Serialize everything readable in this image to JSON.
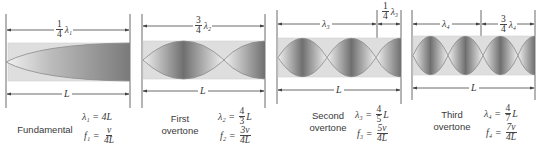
{
  "figure": {
    "colors": {
      "tube_fill": "#d9d9d9",
      "tube_border": "#c8c8c8",
      "node_dark": "#6e6e6e",
      "wave_line": "#8a8a8a",
      "dim_line": "#444444",
      "text": "#333333"
    },
    "panels": [
      {
        "id": "fundamental",
        "top_dimension": [
          {
            "type": "fraction",
            "num": "1",
            "den": "4",
            "symbol": "λ₁"
          }
        ],
        "bottom_dimension": "L",
        "label_lines": [
          "Fundamental"
        ],
        "wavelength_eq": {
          "lhs": "λ₁ =",
          "rhs_plain": "4L"
        },
        "frequency_eq": {
          "lhs": "f₁ =",
          "num": "v",
          "den": "4L"
        },
        "quarter_waves": 1
      },
      {
        "id": "first-overtone",
        "top_dimension": [
          {
            "type": "fraction",
            "num": "3",
            "den": "4",
            "symbol": "λ₂"
          }
        ],
        "bottom_dimension": "L",
        "label_lines": [
          "First",
          "overtone"
        ],
        "wavelength_eq": {
          "lhs": "λ₂ =",
          "num": "4",
          "den": "3",
          "suffix": "L"
        },
        "frequency_eq": {
          "lhs": "f₂ =",
          "num": "3v",
          "den": "4L"
        },
        "quarter_waves": 3
      },
      {
        "id": "second-overtone",
        "top_dimension": [
          {
            "type": "plain",
            "symbol": "λ₃"
          },
          {
            "type": "fraction",
            "num": "1",
            "den": "4",
            "symbol": "λ₃"
          }
        ],
        "bottom_dimension": "L",
        "label_lines": [
          "Second",
          "overtone"
        ],
        "wavelength_eq": {
          "lhs": "λ₃ =",
          "num": "4",
          "den": "5",
          "suffix": "L"
        },
        "frequency_eq": {
          "lhs": "f₃ =",
          "num": "5v",
          "den": "4L"
        },
        "quarter_waves": 5
      },
      {
        "id": "third-overtone",
        "top_dimension": [
          {
            "type": "plain",
            "symbol": "λ₄"
          },
          {
            "type": "fraction",
            "num": "3",
            "den": "4",
            "symbol": "λ₄"
          }
        ],
        "bottom_dimension": "L",
        "label_lines": [
          "Third",
          "overtone"
        ],
        "wavelength_eq": {
          "lhs": "λ₄ =",
          "num": "4",
          "den": "7",
          "suffix": "L"
        },
        "frequency_eq": {
          "lhs": "f₄ =",
          "num": "7v",
          "den": "4L"
        },
        "quarter_waves": 7
      }
    ]
  }
}
